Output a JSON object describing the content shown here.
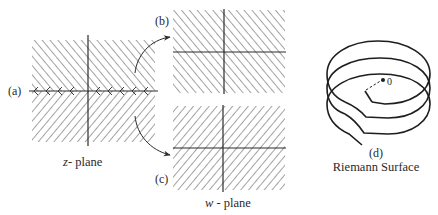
{
  "diagram": {
    "colors": {
      "ink": "#2a2a2a",
      "hatch": "#555555",
      "background": "#ffffff"
    },
    "panels": {
      "a": {
        "label": "(a)",
        "caption_var": "z",
        "caption_rest": "- plane",
        "hatch_upper": "forward-diagonal",
        "hatch_lower": "back-diagonal"
      },
      "b": {
        "label": "(b)",
        "hatch": "forward-diagonal"
      },
      "c": {
        "label": "(c)",
        "hatch": "back-diagonal"
      },
      "w_plane": {
        "caption_var": "w",
        "caption_rest": " - plane"
      },
      "d": {
        "label": "(d)",
        "caption": "Riemann Surface",
        "origin_label": "0",
        "loops": 3
      }
    },
    "arrows": [
      {
        "from": "a-upper-half",
        "to": "b"
      },
      {
        "from": "a-lower-half",
        "to": "c"
      }
    ]
  }
}
